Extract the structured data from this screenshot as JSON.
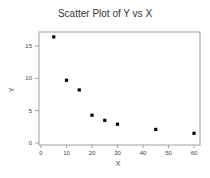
{
  "chart_data": {
    "type": "scatter",
    "title": "Scatter Plot of Y vs X",
    "xlabel": "X",
    "ylabel": "Y",
    "xlim": [
      -1,
      62
    ],
    "ylim": [
      -0.3,
      17
    ],
    "xticks": [
      0,
      10,
      20,
      30,
      40,
      50,
      60
    ],
    "yticks": [
      0,
      5,
      10,
      15
    ],
    "grid": false,
    "legend": null,
    "series": [
      {
        "name": "Y vs X",
        "marker": "square",
        "color": "#000000",
        "x": [
          5,
          10,
          15,
          20,
          25,
          30,
          45,
          60
        ],
        "y": [
          16.4,
          9.7,
          8.2,
          4.3,
          3.5,
          2.9,
          2.1,
          1.5
        ]
      }
    ]
  }
}
